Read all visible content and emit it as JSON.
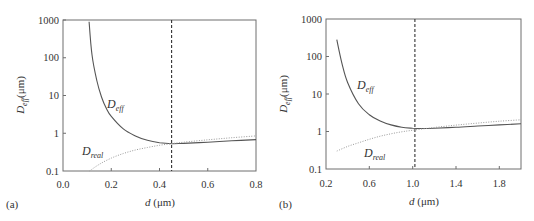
{
  "chart_data": [
    {
      "panel": "(a)",
      "type": "line",
      "xlabel": "d (μm)",
      "ylabel": "D_eff(μm)",
      "xlim": [
        0.0,
        0.8
      ],
      "ylim": [
        0.1,
        1000
      ],
      "yscale": "log",
      "xticks": [
        "0.0",
        "0.2",
        "0.4",
        "0.6",
        "0.8"
      ],
      "yticks": [
        "0.1",
        "1",
        "10",
        "100",
        "1000"
      ],
      "vline": 0.45,
      "grid": false,
      "series": [
        {
          "name": "D_eff",
          "style": "solid",
          "x": [
            0.108,
            0.12,
            0.14,
            0.16,
            0.18,
            0.2,
            0.25,
            0.3,
            0.35,
            0.4,
            0.45,
            0.5,
            0.6,
            0.7,
            0.8
          ],
          "y": [
            900,
            120,
            25,
            9,
            4.5,
            2.8,
            1.3,
            0.85,
            0.65,
            0.56,
            0.53,
            0.54,
            0.58,
            0.63,
            0.68
          ]
        },
        {
          "name": "D_real",
          "style": "dotted",
          "x": [
            0.11,
            0.15,
            0.2,
            0.25,
            0.3,
            0.35,
            0.4,
            0.45,
            0.5,
            0.6,
            0.7,
            0.8
          ],
          "y": [
            0.1,
            0.15,
            0.22,
            0.29,
            0.36,
            0.42,
            0.48,
            0.53,
            0.58,
            0.67,
            0.76,
            0.85
          ]
        }
      ],
      "annotations": [
        "D_eff",
        "D_real"
      ]
    },
    {
      "panel": "(b)",
      "type": "line",
      "xlabel": "d (μm)",
      "ylabel": "D_eff(μm)",
      "xlim": [
        0.2,
        2.0
      ],
      "ylim": [
        0.1,
        1000
      ],
      "yscale": "log",
      "xticks": [
        "0.2",
        "0.6",
        "1.0",
        "1.4",
        "1.8"
      ],
      "yticks": [
        "0.1",
        "1",
        "10",
        "100",
        "1000"
      ],
      "vline": 1.02,
      "grid": false,
      "series": [
        {
          "name": "D_eff",
          "style": "solid",
          "x": [
            0.3,
            0.35,
            0.4,
            0.5,
            0.6,
            0.7,
            0.8,
            0.9,
            1.0,
            1.1,
            1.2,
            1.4,
            1.6,
            1.8,
            2.0
          ],
          "y": [
            280,
            60,
            20,
            5.5,
            2.8,
            1.9,
            1.5,
            1.3,
            1.22,
            1.2,
            1.22,
            1.3,
            1.4,
            1.5,
            1.6
          ]
        },
        {
          "name": "D_real",
          "style": "dotted",
          "x": [
            0.3,
            0.4,
            0.5,
            0.6,
            0.7,
            0.8,
            0.9,
            1.0,
            1.2,
            1.4,
            1.6,
            1.8,
            2.0
          ],
          "y": [
            0.3,
            0.4,
            0.5,
            0.62,
            0.75,
            0.87,
            0.98,
            1.08,
            1.28,
            1.48,
            1.68,
            1.88,
            2.05
          ]
        }
      ],
      "annotations": [
        "D_eff",
        "D_real"
      ]
    }
  ],
  "panels": [
    {
      "label": "(a)",
      "xlabel_var": "d",
      "xlabel_unit": " (μm)",
      "ylabel_main": "D",
      "ylabel_sub": "eff",
      "ylabel_unit": "(μm)",
      "curve_label_eff_main": "D",
      "curve_label_eff_sub": "eff",
      "curve_label_real_main": "D",
      "curve_label_real_sub": "real",
      "xticks": [
        "0.0",
        "0.2",
        "0.4",
        "0.6",
        "0.8"
      ],
      "yticks": [
        "0.1",
        "1",
        "10",
        "100",
        "1000"
      ]
    },
    {
      "label": "(b)",
      "xlabel_var": "d",
      "xlabel_unit": " (μm)",
      "ylabel_main": "D",
      "ylabel_sub": "eff",
      "ylabel_unit": "(μm)",
      "curve_label_eff_main": "D",
      "curve_label_eff_sub": "eff",
      "curve_label_real_main": "D",
      "curve_label_real_sub": "real",
      "xticks": [
        "0.2",
        "0.6",
        "1.0",
        "1.4",
        "1.8"
      ],
      "yticks": [
        "0.1",
        "1",
        "10",
        "100",
        "1000"
      ]
    }
  ],
  "colors": {
    "axis": "#6e6e6e",
    "curve_eff": "#555555",
    "curve_real": "#9a9a9a",
    "vline": "#333333",
    "text": "#333333"
  }
}
